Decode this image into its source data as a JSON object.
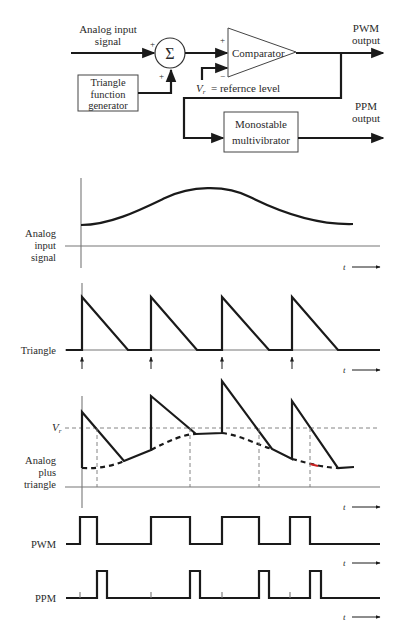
{
  "block_diagram": {
    "analog_input_label_1": "Analog input",
    "analog_input_label_2": "signal",
    "summer_symbol": "Σ",
    "summer_plus_left": "+",
    "summer_plus_bottom": "+",
    "triangle_generator": [
      "Triangle",
      "function",
      "generator"
    ],
    "comparator_label": "Comparator",
    "comparator_plus": "+",
    "comparator_minus": "−",
    "reference_label": "= refernce level",
    "reference_symbol": "V",
    "reference_subscript": "r",
    "pwm_output": [
      "PWM",
      "output"
    ],
    "ppm_output": [
      "PPM",
      "output"
    ],
    "monostable": [
      "Monostable",
      "multivibrator"
    ]
  },
  "waveforms": {
    "analog_input": {
      "label": [
        "Analog",
        "input",
        "signal"
      ],
      "t_label": "t"
    },
    "triangle": {
      "label": "Triangle",
      "t_label": "t"
    },
    "analog_plus_triangle": {
      "label": [
        "Analog",
        "plus",
        "triangle"
      ],
      "vr_symbol": "V",
      "vr_subscript": "r",
      "t_label": "t"
    },
    "pwm": {
      "label": "PWM",
      "t_label": "t"
    },
    "ppm": {
      "label": "PPM",
      "t_label": "t"
    }
  },
  "colors": {
    "line": "#1a1a1a",
    "axis": "#777777",
    "highlight": "#cc2222"
  }
}
